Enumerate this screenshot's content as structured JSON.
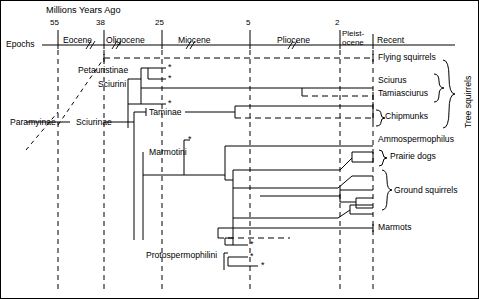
{
  "figure": {
    "axis_title": "Millions Years Ago",
    "row_label": "Epochs",
    "ticks": [
      {
        "value": "55",
        "x": 58
      },
      {
        "value": "38",
        "x": 104
      },
      {
        "value": "25",
        "x": 162
      },
      {
        "value": "5",
        "x": 250
      },
      {
        "value": "2",
        "x": 340
      }
    ],
    "epochs": [
      {
        "name": "Eocene",
        "x": 80
      },
      {
        "name": "Oligocene",
        "x": 133
      },
      {
        "name": "Miocene",
        "x": 206
      },
      {
        "name": "Pliocene",
        "x": 295
      },
      {
        "name": "Pleist-",
        "x": 356
      },
      {
        "name": "ocene",
        "x": 356
      },
      {
        "name": "Recent",
        "x": 402
      }
    ]
  },
  "left_taxa": [
    {
      "name": "Paramyinae",
      "x": 10,
      "y": 122
    },
    {
      "name": "Sciurinae",
      "x": 76,
      "y": 122
    },
    {
      "name": "Petauristinae",
      "x": 80,
      "y": 73
    },
    {
      "name": "Sciurini",
      "x": 100,
      "y": 86
    },
    {
      "name": "Taminae",
      "x": 148,
      "y": 114
    },
    {
      "name": "Marmotini",
      "x": 148,
      "y": 155
    },
    {
      "name": "Protospermophilini",
      "x": 146,
      "y": 257
    }
  ],
  "right_taxa": [
    {
      "name": "Flying squirrels",
      "x": 378,
      "y": 58
    },
    {
      "name": "Sciurus",
      "x": 378,
      "y": 81
    },
    {
      "name": "Tamiasciurus",
      "x": 378,
      "y": 94
    },
    {
      "name": "Chipmunks",
      "x": 383,
      "y": 117
    },
    {
      "name": "Ammospermophilus",
      "x": 378,
      "y": 140
    },
    {
      "name": "Prairie dogs",
      "x": 388,
      "y": 157
    },
    {
      "name": "Ground squirrels",
      "x": 390,
      "y": 192
    },
    {
      "name": "Marmots",
      "x": 378,
      "y": 223
    }
  ],
  "group_brackets": [
    {
      "name": "Tree squirrels",
      "x": 455,
      "y": 60
    }
  ],
  "extinct_markers": [
    {
      "x": 168,
      "y": 68
    },
    {
      "x": 168,
      "y": 79
    },
    {
      "x": 168,
      "y": 104
    },
    {
      "x": 191,
      "y": 141
    },
    {
      "x": 250,
      "y": 245
    },
    {
      "x": 250,
      "y": 257
    },
    {
      "x": 261,
      "y": 266
    }
  ],
  "colors": {
    "line": "#000000",
    "background": "#ffffff",
    "border": "#000000"
  },
  "legend": {
    "asterisk_meaning": "*"
  }
}
